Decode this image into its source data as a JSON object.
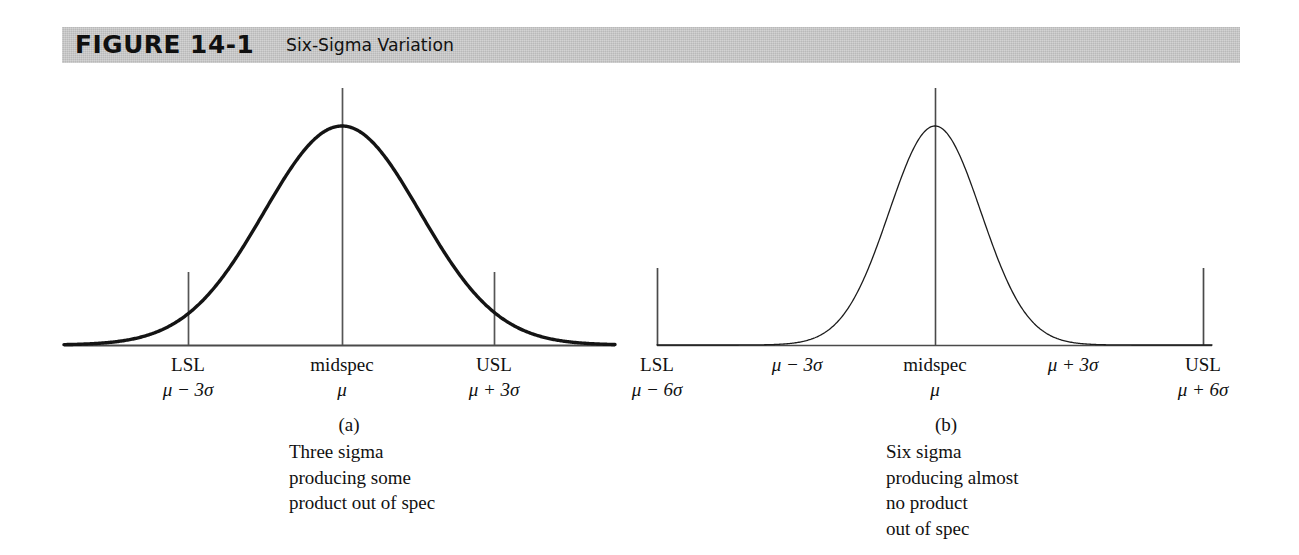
{
  "header": {
    "figure_number": "FIGURE 14-1",
    "subtitle": "Six-Sigma Variation",
    "bar_color": "#b9b9b9"
  },
  "panels": [
    {
      "id": "a",
      "caption_id": "(a)",
      "caption_lines": [
        "Three sigma",
        "producing some",
        "product out of spec"
      ],
      "ticks": [
        {
          "name": "lsl",
          "row1": "LSL",
          "row2": "μ − 3σ"
        },
        {
          "name": "midspec",
          "row1": "midspec",
          "row2": "μ"
        },
        {
          "name": "usl",
          "row1": "USL",
          "row2": "μ + 3σ"
        }
      ]
    },
    {
      "id": "b",
      "caption_id": "(b)",
      "caption_lines": [
        "Six sigma",
        "producing almost",
        "no product",
        "out of spec"
      ],
      "ticks": [
        {
          "name": "lsl",
          "row1": "LSL",
          "row2": "μ − 6σ"
        },
        {
          "name": "minus3sigma",
          "row1": "μ − 3σ",
          "row2": ""
        },
        {
          "name": "midspec",
          "row1": "midspec",
          "row2": "μ"
        },
        {
          "name": "plus3sigma",
          "row1": "μ + 3σ",
          "row2": ""
        },
        {
          "name": "usl",
          "row1": "USL",
          "row2": "μ + 6σ"
        }
      ]
    }
  ],
  "chart_data": {
    "type": "line",
    "title": "Six-Sigma Variation",
    "xlabel": "",
    "ylabel": "",
    "grid": false,
    "legend": null,
    "series": [
      {
        "name": "Three sigma distribution",
        "panel": "a",
        "distribution": "normal",
        "mean_label": "μ",
        "sigma_px": 78,
        "peak_px": {
          "x": 342,
          "y": 126
        },
        "baseline_y_px": 345,
        "x_domain_px": [
          64,
          615
        ],
        "stroke_width_px": 3.4,
        "spec_limits": {
          "lower": "μ − 3σ",
          "upper": "μ + 3σ"
        },
        "spec_limit_x_px": [
          188,
          494
        ],
        "out_of_spec": "some product out of spec"
      },
      {
        "name": "Six sigma distribution",
        "panel": "b",
        "distribution": "normal",
        "mean_label": "μ",
        "sigma_px": 46,
        "peak_px": {
          "x": 935,
          "y": 126
        },
        "baseline_y_px": 345,
        "x_domain_px": [
          657,
          1212
        ],
        "stroke_width_px": 1.3,
        "spec_limits": {
          "lower": "μ − 6σ",
          "upper": "μ + 6σ"
        },
        "spec_limit_x_px": [
          657,
          1203
        ],
        "out_of_spec": "almost no product out of spec"
      }
    ],
    "annotations": [
      {
        "panel": "a",
        "text": "LSL",
        "sublabel": "μ − 3σ",
        "x_px": 188
      },
      {
        "panel": "a",
        "text": "midspec",
        "sublabel": "μ",
        "x_px": 342
      },
      {
        "panel": "a",
        "text": "USL",
        "sublabel": "μ + 3σ",
        "x_px": 494
      },
      {
        "panel": "b",
        "text": "LSL",
        "sublabel": "μ − 6σ",
        "x_px": 657
      },
      {
        "panel": "b",
        "text": "μ − 3σ",
        "sublabel": "",
        "x_px": 797
      },
      {
        "panel": "b",
        "text": "midspec",
        "sublabel": "μ",
        "x_px": 935
      },
      {
        "panel": "b",
        "text": "μ + 3σ",
        "sublabel": "",
        "x_px": 1073
      },
      {
        "panel": "b",
        "text": "USL",
        "sublabel": "μ + 6σ",
        "x_px": 1203
      }
    ]
  }
}
